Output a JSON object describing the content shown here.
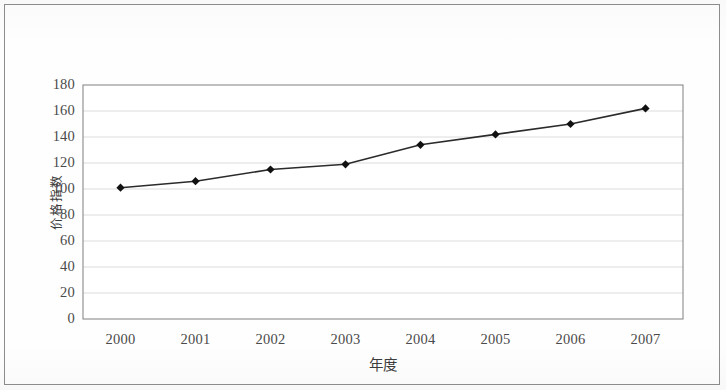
{
  "chart_data": {
    "type": "line",
    "title": "",
    "subtitle": "",
    "xlabel": "年度",
    "ylabel": "价格指数",
    "categories": [
      "2000",
      "2001",
      "2002",
      "2003",
      "2004",
      "2005",
      "2006",
      "2007"
    ],
    "values": [
      101,
      106,
      115,
      119,
      134,
      142,
      150,
      162
    ],
    "series": [
      {
        "name": "价格指数",
        "values": [
          101,
          106,
          115,
          119,
          134,
          142,
          150,
          162
        ]
      }
    ],
    "ylim": [
      0,
      180
    ],
    "ytick_labels": [
      "0",
      "20",
      "40",
      "60",
      "80",
      "100",
      "120",
      "140",
      "160",
      "180"
    ],
    "ytick_values": [
      0,
      20,
      40,
      60,
      80,
      100,
      120,
      140,
      160,
      180
    ],
    "xtick_labels": [
      "2000",
      "2001",
      "2002",
      "2003",
      "2004",
      "2005",
      "2006",
      "2007"
    ],
    "grid": "horizontal",
    "legend": "none",
    "marker": "diamond",
    "line_color": "#2b2b2b",
    "marker_color": "#111111",
    "grid_color": "#d8d8d8",
    "axis_color": "#7a7a7a",
    "plot_background": "#ffffff"
  }
}
